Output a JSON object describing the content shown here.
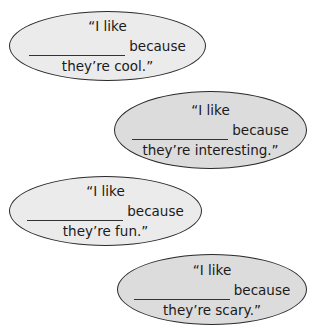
{
  "bubbles": [
    {
      "line1": "“I like",
      "line2": "because",
      "line3": "they’re cool.”"
    },
    {
      "line1": "“I like",
      "line2": "because",
      "line3": "they’re interesting.”"
    },
    {
      "line1": "“I like",
      "line2": "because",
      "line3": "they’re fun.”"
    },
    {
      "line1": "“I like",
      "line2": "because",
      "line3": "they’re scary.”"
    }
  ]
}
